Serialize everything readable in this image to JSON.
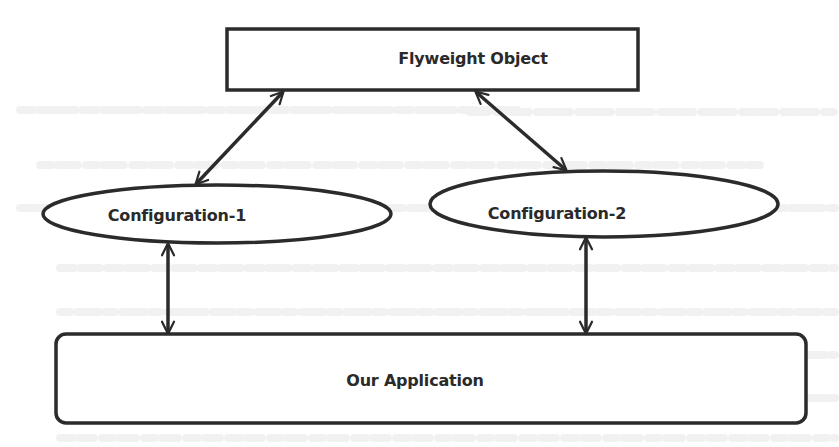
{
  "diagram": {
    "type": "flowchart",
    "stroke_color": "#2b2b2b",
    "text_color": "#2a2a2a",
    "background_color": "#ffffff",
    "nodes": [
      {
        "id": "flyweight",
        "label": "Flyweight Object",
        "shape": "rectangle"
      },
      {
        "id": "config1",
        "label": "Configuration-1",
        "shape": "ellipse"
      },
      {
        "id": "config2",
        "label": "Configuration-2",
        "shape": "ellipse"
      },
      {
        "id": "app",
        "label": "Our Application",
        "shape": "rounded-rectangle"
      }
    ],
    "edges": [
      {
        "from": "flyweight",
        "to": "config1",
        "direction": "bidirectional"
      },
      {
        "from": "flyweight",
        "to": "config2",
        "direction": "bidirectional"
      },
      {
        "from": "config1",
        "to": "app",
        "direction": "bidirectional"
      },
      {
        "from": "config2",
        "to": "app",
        "direction": "bidirectional"
      }
    ]
  },
  "background_bleed_text": {
    "lines": [
      "",
      "",
      "",
      "",
      "",
      ""
    ]
  }
}
